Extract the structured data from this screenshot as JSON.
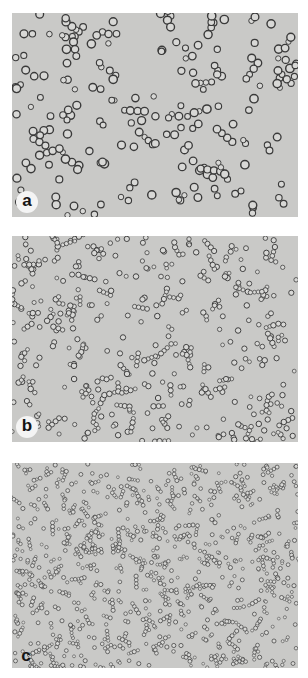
{
  "figure": {
    "panels": [
      {
        "id": "a",
        "label": "a",
        "top": 13,
        "cell_count": 230,
        "cell_radius": [
          2.6,
          4.2
        ],
        "label_style": "circle",
        "label_pos": [
          4,
          178
        ],
        "seed": 11
      },
      {
        "id": "b",
        "label": "b",
        "top": 236,
        "cell_count": 520,
        "cell_radius": [
          1.9,
          2.8
        ],
        "label_style": "circle",
        "label_pos": [
          4,
          180
        ],
        "seed": 37
      },
      {
        "id": "c",
        "label": "c",
        "top": 463,
        "cell_count": 1100,
        "cell_radius": [
          1.4,
          2.1
        ],
        "label_style": "plain",
        "label_pos": [
          5,
          184
        ],
        "seed": 73
      }
    ],
    "colors": {
      "background": "#c9c9c7",
      "cell_edge": "#3a3a3a",
      "cell_fill": "#d8d8d6",
      "label_bg": "#f4f4f4"
    }
  }
}
